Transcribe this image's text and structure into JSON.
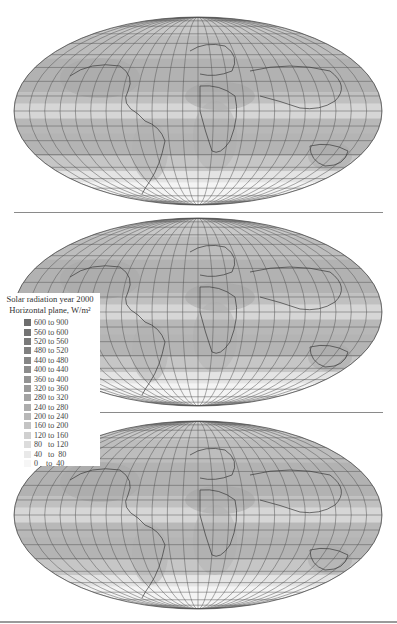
{
  "figure": {
    "type": "map",
    "projection": "Mollweide",
    "panels": [
      {
        "id": "map-1",
        "description": "world map solar radiation panel 1"
      },
      {
        "id": "map-2",
        "description": "world map solar radiation panel 2"
      },
      {
        "id": "map-3",
        "description": "world map solar radiation panel 3"
      }
    ]
  },
  "legend": {
    "title_line1": "Solar radiation year 2000",
    "title_line2": "Horizontal plane, W/m²",
    "items": [
      {
        "label": "600 to 900",
        "color": "#6e6e6e"
      },
      {
        "label": "560 to 600",
        "color": "#747474"
      },
      {
        "label": "520 to 560",
        "color": "#7a7a7a"
      },
      {
        "label": "480 to 520",
        "color": "#808080"
      },
      {
        "label": "440 to 480",
        "color": "#868686"
      },
      {
        "label": "400 to 440",
        "color": "#8c8c8c"
      },
      {
        "label": "360 to 400",
        "color": "#939393"
      },
      {
        "label": "320 to 360",
        "color": "#9a9a9a"
      },
      {
        "label": "280 to 320",
        "color": "#a3a3a3"
      },
      {
        "label": "240 to 280",
        "color": "#adadad"
      },
      {
        "label": "200 to 240",
        "color": "#b8b8b8"
      },
      {
        "label": "160 to 200",
        "color": "#c4c4c4"
      },
      {
        "label": "120 to 160",
        "color": "#d0d0d0"
      },
      {
        "label": "80   to 120",
        "color": "#dcdcdc"
      },
      {
        "label": "40   to  80",
        "color": "#e9e9e9"
      },
      {
        "label": "0    to  40",
        "color": "#f6f6f6"
      }
    ]
  },
  "colors": {
    "grid": "#555555",
    "separator": "#8a8a8a",
    "band_dark": "#bdbdbd",
    "band_light": "#dedede"
  }
}
